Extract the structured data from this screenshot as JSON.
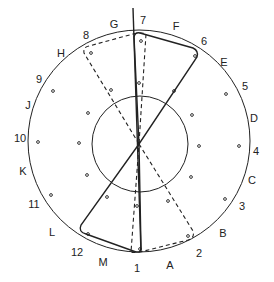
{
  "diagram": {
    "outer_circle": {
      "cx": 139,
      "cy": 141,
      "r": 111
    },
    "inner_circle": {
      "cx": 140,
      "cy": 144,
      "r": 48
    },
    "center": {
      "x": 139,
      "y": 144
    },
    "labels": [
      {
        "text": "G",
        "x": 114,
        "y": 28
      },
      {
        "text": "7",
        "x": 143,
        "y": 24
      },
      {
        "text": "F",
        "x": 176,
        "y": 30
      },
      {
        "text": "6",
        "x": 204,
        "y": 45
      },
      {
        "text": "E",
        "x": 224,
        "y": 66
      },
      {
        "text": "5",
        "x": 245,
        "y": 90
      },
      {
        "text": "D",
        "x": 254,
        "y": 122
      },
      {
        "text": "4",
        "x": 256,
        "y": 155
      },
      {
        "text": "C",
        "x": 252,
        "y": 184
      },
      {
        "text": "3",
        "x": 242,
        "y": 210
      },
      {
        "text": "B",
        "x": 223,
        "y": 237
      },
      {
        "text": "2",
        "x": 199,
        "y": 257
      },
      {
        "text": "A",
        "x": 170,
        "y": 269
      },
      {
        "text": "1",
        "x": 137,
        "y": 272
      },
      {
        "text": "M",
        "x": 103,
        "y": 266
      },
      {
        "text": "12",
        "x": 77,
        "y": 256
      },
      {
        "text": "L",
        "x": 52,
        "y": 236
      },
      {
        "text": "11",
        "x": 34,
        "y": 208
      },
      {
        "text": "K",
        "x": 23,
        "y": 175
      },
      {
        "text": "10",
        "x": 20,
        "y": 142
      },
      {
        "text": "J",
        "x": 28,
        "y": 109
      },
      {
        "text": "9",
        "x": 39,
        "y": 83
      },
      {
        "text": "H",
        "x": 61,
        "y": 57
      },
      {
        "text": "8",
        "x": 86,
        "y": 39
      }
    ],
    "dots": [
      [
        141,
        41
      ],
      [
        195,
        56
      ],
      [
        91,
        53
      ],
      [
        53,
        91
      ],
      [
        111,
        90
      ],
      [
        88,
        113
      ],
      [
        174,
        91
      ],
      [
        226,
        94
      ],
      [
        192,
        115
      ],
      [
        139,
        83
      ],
      [
        38,
        142
      ],
      [
        79,
        143
      ],
      [
        199,
        146
      ],
      [
        239,
        146
      ],
      [
        87,
        175
      ],
      [
        191,
        177
      ],
      [
        51,
        195
      ],
      [
        225,
        199
      ],
      [
        107,
        197
      ],
      [
        168,
        201
      ],
      [
        137,
        206
      ],
      [
        88,
        234
      ],
      [
        188,
        236
      ],
      [
        140,
        249
      ]
    ],
    "solid_vertical": {
      "x1": 133,
      "y1": 8,
      "x2": 141,
      "y2": 252
    },
    "solid_upper_polygon": "M139,144 L134,37 Q135,32 140,33 L193,48 Q199,51 197,57 Z",
    "solid_lower_polygon": "M139,144 L81,225 Q78,232 86,234 L136,252 Q141,253 141,248 Z",
    "dashed_upper_polygon": "M139,144 L84,53 Q83,47 89,46 L133,34 Q142,32 146,34 Z",
    "dashed_lower_polygon": "M139,144 L193,231 Q195,238 188,240 L140,252 Q133,253 131,252 Z",
    "colors": {
      "stroke": "#222222",
      "background": "#ffffff"
    }
  }
}
